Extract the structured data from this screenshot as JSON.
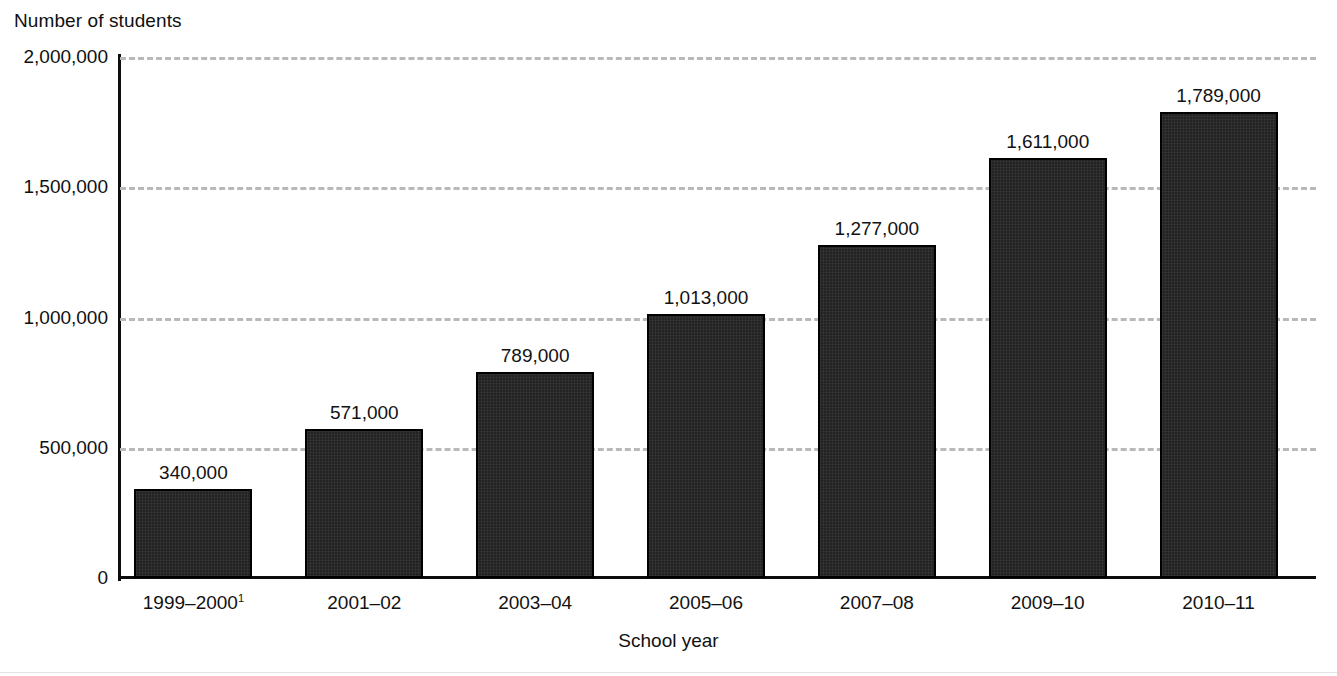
{
  "chart_data": {
    "type": "bar",
    "title": "",
    "xlabel": "School year",
    "ylabel": "Number of students",
    "categories": [
      "1999–2000",
      "2001–02",
      "2003–04",
      "2005–06",
      "2007–08",
      "2009–10",
      "2010–11"
    ],
    "category_footnotes": [
      "1",
      "",
      "",
      "",
      "",
      "",
      ""
    ],
    "values": [
      340000,
      571000,
      789000,
      1013000,
      1277000,
      1611000,
      1789000
    ],
    "value_labels": [
      "340,000",
      "571,000",
      "789,000",
      "1,013,000",
      "1,277,000",
      "1,611,000",
      "1,789,000"
    ],
    "ylim": [
      0,
      2000000
    ],
    "yticks": [
      0,
      500000,
      1000000,
      1500000,
      2000000
    ],
    "ytick_labels": [
      "0",
      "500,000",
      "1,000,000",
      "1,500,000",
      "2,000,000"
    ],
    "grid": "horizontal-dashed",
    "legend": "none",
    "bar_color": "#232323",
    "bar_edge_color": "#000000",
    "gridline_color": "#b9b9b9",
    "axis_color": "#0d0d0d"
  },
  "axes": {
    "y_title": "Number of students",
    "x_title": "School year"
  }
}
